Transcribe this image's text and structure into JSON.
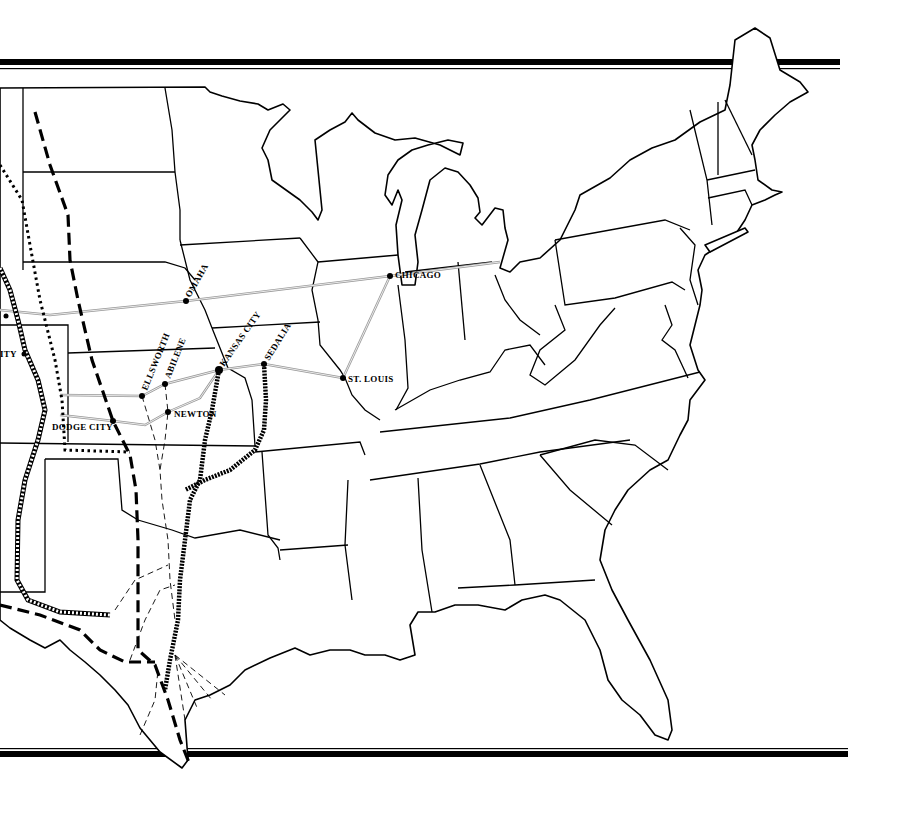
{
  "map": {
    "title": "",
    "subject": "Cattle trails and railroads of the central and eastern United States",
    "colors": {
      "background": "#ffffff",
      "state_line": "#000000",
      "railroad": "#999999",
      "trail": "#000000"
    },
    "cities": [
      {
        "name": "OMAHA",
        "x": 186,
        "y": 301
      },
      {
        "name": "CHICAGO",
        "x": 390,
        "y": 276
      },
      {
        "name": "ST. LOUIS",
        "x": 343,
        "y": 378
      },
      {
        "name": "KANSAS CITY",
        "x": 219,
        "y": 370
      },
      {
        "name": "SEDALIA",
        "x": 264,
        "y": 364
      },
      {
        "name": "ELLSWORTH",
        "x": 142,
        "y": 395
      },
      {
        "name": "ABILENE",
        "x": 165,
        "y": 384
      },
      {
        "name": "NEWTON",
        "x": 168,
        "y": 412
      },
      {
        "name": "DODGE CITY",
        "x": 113,
        "y": 421
      },
      {
        "name": "ITY",
        "x": 22,
        "y": 354
      }
    ],
    "labels": {
      "omaha": "OMAHA",
      "chicago": "CHICAGO",
      "st_louis": "ST. LOUIS",
      "kansas_city": "KANSAS CITY",
      "sedalia": "SEDALIA",
      "ellsworth": "ELLSWORTH",
      "abilene": "ABILENE",
      "newton": "NEWTON",
      "dodge_city": "DODGE CITY",
      "partial_city": "ITY"
    },
    "line_styles": [
      {
        "name": "railroad",
        "style": "gray double line"
      },
      {
        "name": "trail-heavy-dashed",
        "style": "heavy dashed"
      },
      {
        "name": "trail-dotted",
        "style": "dotted"
      },
      {
        "name": "trail-ladder",
        "style": "double hatched"
      },
      {
        "name": "trail-chain",
        "style": "chain / zigzag"
      },
      {
        "name": "feeder-trails",
        "style": "thin dashed"
      }
    ]
  }
}
